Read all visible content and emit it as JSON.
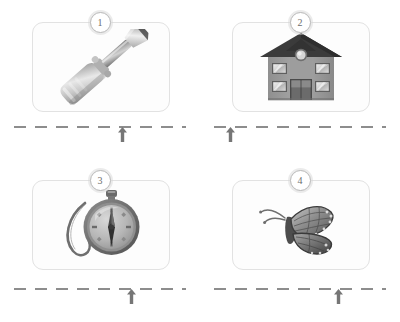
{
  "worksheet": {
    "title": "Handwriting tracing worksheet",
    "page_background": "#ffffff",
    "line_color": "#8d8d8d",
    "card_border_color": "#e2e2e2",
    "badge_text_color": "#6d6d6d"
  },
  "items": [
    {
      "number": "1",
      "picture": "screwdriver-illustration",
      "picture_label": "screwdriver",
      "line": {
        "style": "dashed",
        "arrow_marker": "up-arrow-start-marker",
        "arrow_position_percent": 63
      }
    },
    {
      "number": "2",
      "picture": "house-illustration",
      "picture_label": "house",
      "line": {
        "style": "dashed",
        "arrow_marker": "up-arrow-start-marker",
        "arrow_position_percent": 7
      }
    },
    {
      "number": "3",
      "picture": "compass-illustration",
      "picture_label": "compass",
      "line": {
        "style": "dashed",
        "arrow_marker": "up-arrow-start-marker",
        "arrow_position_percent": 68
      }
    },
    {
      "number": "4",
      "picture": "butterfly-illustration",
      "picture_label": "butterfly",
      "line": {
        "style": "dashed",
        "arrow_marker": "up-arrow-start-marker",
        "arrow_position_percent": 72
      }
    }
  ]
}
